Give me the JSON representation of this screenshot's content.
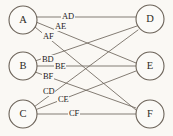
{
  "figure": {
    "background_color": "#faf8f4",
    "line_color": "#6e665c",
    "node_fill": "#fbfaf7",
    "node_stroke": "#6b6258",
    "text_color": "#24211d"
  },
  "nodes": {
    "left": [
      {
        "id": "A",
        "label": "A",
        "cx": 23,
        "cy": 20,
        "r": 14
      },
      {
        "id": "B",
        "label": "B",
        "cx": 23,
        "cy": 66,
        "r": 14
      },
      {
        "id": "C",
        "label": "C",
        "cx": 23,
        "cy": 114,
        "r": 14
      }
    ],
    "right": [
      {
        "id": "D",
        "label": "D",
        "cx": 150,
        "cy": 19,
        "r": 14
      },
      {
        "id": "E",
        "label": "E",
        "cx": 150,
        "cy": 66,
        "r": 14
      },
      {
        "id": "F",
        "label": "F",
        "cx": 150,
        "cy": 114,
        "r": 14
      }
    ]
  },
  "edges": [
    {
      "id": "AD",
      "label": "AD",
      "from": "A",
      "to": "D",
      "x1": 37,
      "y1": 17,
      "x2": 136,
      "y2": 17,
      "label_x": 61,
      "label_y": 12
    },
    {
      "id": "AE",
      "label": "AE",
      "from": "A",
      "to": "E",
      "x1": 36,
      "y1": 22,
      "x2": 136,
      "y2": 63,
      "label_x": 54,
      "label_y": 22
    },
    {
      "id": "AF",
      "label": "AF",
      "from": "A",
      "to": "F",
      "x1": 35,
      "y1": 27,
      "x2": 136,
      "y2": 110,
      "label_x": 42,
      "label_y": 32
    },
    {
      "id": "BD",
      "label": "BD",
      "from": "B",
      "to": "D",
      "x1": 35,
      "y1": 61,
      "x2": 137,
      "y2": 26,
      "label_x": 41,
      "label_y": 55
    },
    {
      "id": "BE",
      "label": "BE",
      "from": "B",
      "to": "E",
      "x1": 37,
      "y1": 66,
      "x2": 136,
      "y2": 66,
      "label_x": 54,
      "label_y": 62
    },
    {
      "id": "BF",
      "label": "BF",
      "from": "B",
      "to": "F",
      "x1": 35,
      "y1": 72,
      "x2": 136,
      "y2": 108,
      "label_x": 42,
      "label_y": 72
    },
    {
      "id": "CD",
      "label": "CD",
      "from": "C",
      "to": "D",
      "x1": 34,
      "y1": 107,
      "x2": 138,
      "y2": 30,
      "label_x": 42,
      "label_y": 87
    },
    {
      "id": "CE",
      "label": "CE",
      "from": "C",
      "to": "E",
      "x1": 35,
      "y1": 110,
      "x2": 136,
      "y2": 71,
      "label_x": 57,
      "label_y": 95
    },
    {
      "id": "CF",
      "label": "CF",
      "from": "C",
      "to": "F",
      "x1": 37,
      "y1": 114,
      "x2": 136,
      "y2": 114,
      "label_x": 68,
      "label_y": 109
    }
  ]
}
